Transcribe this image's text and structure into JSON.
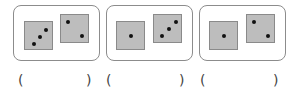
{
  "groups": [
    {
      "dice": [
        {
          "value": 3,
          "pips": [
            [
              9,
              22
            ],
            [
              15,
              15
            ],
            [
              21,
              8
            ]
          ]
        },
        {
          "value": 2,
          "pips": [
            [
              6,
              6
            ],
            [
              20,
              20
            ]
          ]
        }
      ],
      "answer": {
        "open": "(",
        "close": ")",
        "value": ""
      }
    },
    {
      "dice": [
        {
          "value": 1,
          "pips": [
            [
              14,
              14
            ]
          ]
        },
        {
          "value": 3,
          "pips": [
            [
              6,
              20
            ],
            [
              14,
              13
            ],
            [
              22,
              6
            ]
          ]
        }
      ],
      "answer": {
        "open": "(",
        "close": ")",
        "value": ""
      }
    },
    {
      "dice": [
        {
          "value": 1,
          "pips": [
            [
              14,
              14
            ]
          ]
        },
        {
          "value": 2,
          "pips": [
            [
              6,
              6
            ],
            [
              20,
              20
            ]
          ]
        }
      ],
      "answer": {
        "open": "(",
        "close": ")",
        "value": ""
      }
    }
  ]
}
